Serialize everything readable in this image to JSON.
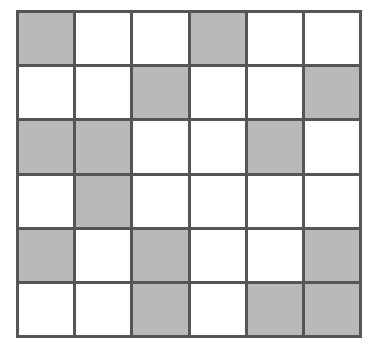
{
  "grid": {
    "rows": 6,
    "cols": 6,
    "colors": {
      "shaded": "#b9b9b9",
      "empty": "#ffffff",
      "line": "#555555"
    },
    "cells": [
      [
        1,
        0,
        0,
        1,
        0,
        0
      ],
      [
        0,
        0,
        1,
        0,
        0,
        1
      ],
      [
        1,
        1,
        0,
        0,
        1,
        0
      ],
      [
        0,
        1,
        0,
        0,
        0,
        0
      ],
      [
        1,
        0,
        1,
        0,
        0,
        1
      ],
      [
        0,
        0,
        1,
        0,
        1,
        1
      ]
    ]
  }
}
